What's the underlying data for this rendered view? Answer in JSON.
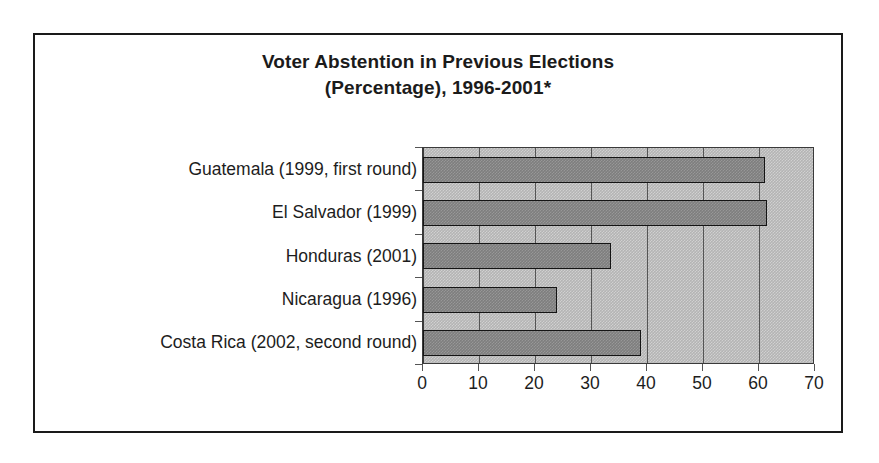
{
  "chart_data": {
    "type": "bar",
    "orientation": "horizontal",
    "title": "Voter Abstention in Previous Elections (Percentage), 1996-2001*",
    "title_line1": "Voter Abstention in Previous Elections",
    "title_line2": "(Percentage), 1996-2001*",
    "xlabel": "",
    "ylabel": "",
    "categories": [
      "Guatemala (1999, first round)",
      "El Salvador (1999)",
      "Honduras (2001)",
      "Nicaragua (1996)",
      "Costa Rica (2002, second round)"
    ],
    "values": [
      61,
      61.5,
      33.5,
      24,
      39
    ],
    "xlim": [
      0,
      70
    ],
    "xticks": [
      0,
      10,
      20,
      30,
      40,
      50,
      60,
      70
    ],
    "xtick_labels": [
      "0",
      "10",
      "20",
      "30",
      "40",
      "50",
      "60",
      "70"
    ],
    "grid": true,
    "grid_axis": "x",
    "legend": false,
    "series": [
      {
        "name": "Voter abstention (%)",
        "values": [
          61,
          61.5,
          33.5,
          24,
          39
        ]
      }
    ],
    "colors": {
      "bar_fill": "#7e7e7e",
      "bar_border": "#141414",
      "plot_background": "#b4b4b4",
      "gridline": "#555555",
      "axis": "#3a3a3a",
      "text": "#1d1d1d",
      "frame_border": "#1a1a1a",
      "page_background": "#ffffff"
    }
  }
}
